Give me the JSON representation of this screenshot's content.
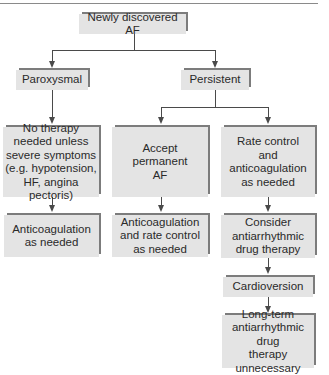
{
  "diagram": {
    "root": {
      "label": "Newly discovered AF"
    },
    "level1": {
      "paroxysmal": {
        "label": "Paroxysmal"
      },
      "persistent": {
        "label": "Persistent"
      }
    },
    "paroxysmal_branch": {
      "step1": {
        "label": "No therapy\nneeded unless\nsevere symptoms\n(e.g. hypotension,\nHF, angina pectoris)"
      },
      "step2": {
        "label": "Anticoagulation\nas needed"
      }
    },
    "permanent_branch": {
      "step1": {
        "label": "Accept\npermanent\nAF"
      },
      "step2": {
        "label": "Anticoagulation\nand rate control\nas needed"
      }
    },
    "rate_control_branch": {
      "step1": {
        "label": "Rate control\nand\nanticoagulation\nas needed"
      },
      "step2": {
        "label": "Consider\nantiarrhythmic\ndrug therapy"
      },
      "step3": {
        "label": "Cardioversion"
      },
      "step4": {
        "label": "Long-term\nantiarrhythmic drug\ntherapy\nunnecessary"
      }
    },
    "colors": {
      "box_fill": "#e4e4e4",
      "box_edge": "#7c7c7c",
      "connector": "#4a4a4a",
      "text": "#2a2a2a"
    }
  }
}
